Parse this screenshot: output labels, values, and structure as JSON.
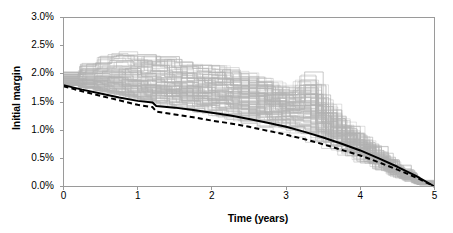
{
  "chart_data": {
    "type": "line",
    "title": "",
    "subtitle": "",
    "xlabel": "Time (years)",
    "ylabel": "Initial margin",
    "xlim": [
      0,
      5
    ],
    "ylim": [
      0,
      0.03
    ],
    "xticks": [
      0,
      1,
      2,
      3,
      4,
      5
    ],
    "xtick_labels": [
      "0",
      "1",
      "2",
      "3",
      "4",
      "5"
    ],
    "yticks": [
      0.0,
      0.005,
      0.01,
      0.015,
      0.02,
      0.025,
      0.03
    ],
    "ytick_labels": [
      "0.0%",
      "0.5%",
      "1.0%",
      "1.5%",
      "2.0%",
      "2.5%",
      "3.0%"
    ],
    "grid": false,
    "legend": "none",
    "annotations": [],
    "series": [
      {
        "name": "Simulated paths",
        "style": "solid",
        "color": "#b3b3b3",
        "linewidth": 0.6,
        "count": 100,
        "description": "Monte Carlo simulated initial margin paths, stepped/sawtooth, amortising to zero at t=5",
        "envelope_upper": {
          "x": [
            0,
            0.25,
            0.5,
            0.75,
            1.0,
            1.25,
            1.5,
            1.75,
            2.0,
            2.25,
            2.5,
            2.75,
            3.0,
            3.25,
            3.5,
            3.75,
            4.0,
            4.25,
            4.5,
            4.75,
            5.0
          ],
          "y": [
            0.0205,
            0.0222,
            0.0236,
            0.0245,
            0.024,
            0.0237,
            0.0228,
            0.0222,
            0.0222,
            0.0215,
            0.0206,
            0.0198,
            0.019,
            0.023,
            0.016,
            0.0135,
            0.011,
            0.0085,
            0.0058,
            0.003,
            0.0
          ]
        },
        "envelope_lower": {
          "x": [
            0,
            0.25,
            0.5,
            0.75,
            1.0,
            1.25,
            1.5,
            1.75,
            2.0,
            2.25,
            2.5,
            2.75,
            3.0,
            3.25,
            3.5,
            3.75,
            4.0,
            4.25,
            4.5,
            4.75,
            5.0
          ],
          "y": [
            0.018,
            0.0175,
            0.0168,
            0.0161,
            0.0153,
            0.0146,
            0.0139,
            0.0132,
            0.0125,
            0.0118,
            0.011,
            0.0102,
            0.0094,
            0.0085,
            0.0075,
            0.0064,
            0.0052,
            0.004,
            0.0027,
            0.0014,
            0.0
          ]
        }
      },
      {
        "name": "Mean path",
        "style": "solid",
        "color": "#000000",
        "linewidth": 2.0,
        "x": [
          0,
          0.25,
          0.5,
          0.75,
          1.0,
          1.2,
          1.25,
          1.5,
          1.75,
          2.0,
          2.25,
          2.5,
          2.75,
          3.0,
          3.25,
          3.5,
          3.75,
          4.0,
          4.25,
          4.5,
          4.75,
          5.0
        ],
        "y": [
          0.018,
          0.0172,
          0.0165,
          0.0158,
          0.0152,
          0.0149,
          0.0143,
          0.014,
          0.0136,
          0.0131,
          0.0126,
          0.012,
          0.0113,
          0.0106,
          0.0097,
          0.0087,
          0.0076,
          0.0064,
          0.005,
          0.0035,
          0.0019,
          0.0
        ]
      },
      {
        "name": "Dashed path",
        "style": "dashed",
        "color": "#000000",
        "linewidth": 2.0,
        "x": [
          0,
          0.25,
          0.5,
          0.75,
          1.0,
          1.2,
          1.25,
          1.5,
          1.75,
          2.0,
          2.25,
          2.5,
          2.75,
          3.0,
          3.25,
          3.5,
          3.75,
          4.0,
          4.25,
          4.5,
          4.75,
          5.0
        ],
        "y": [
          0.0178,
          0.0169,
          0.0161,
          0.0153,
          0.0145,
          0.0141,
          0.0133,
          0.0128,
          0.0123,
          0.0117,
          0.0112,
          0.0106,
          0.0099,
          0.0092,
          0.0084,
          0.0075,
          0.0065,
          0.0055,
          0.0043,
          0.003,
          0.0016,
          0.0
        ]
      }
    ],
    "colors": {
      "paths": "#b3b3b3",
      "mean": "#000000",
      "dashed": "#000000",
      "axis": "#9a9a9a",
      "text": "#000000",
      "background": "#ffffff"
    }
  }
}
